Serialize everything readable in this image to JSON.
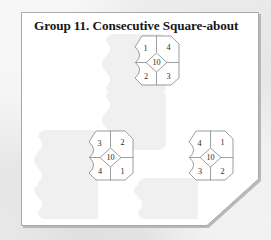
{
  "page": {
    "title": "Group 11. Consecutive Square-about",
    "background_color": "#ebeaea",
    "sheet_color": "#ffffff",
    "line_color": "#8d8d8d",
    "text_color": "#171717",
    "corner_fold": "bottom-right"
  },
  "puzzles": [
    {
      "id": "puzzle-top",
      "center": "10",
      "top_left": "1",
      "top_right": "4",
      "bottom_left": "2",
      "bottom_right": "3"
    },
    {
      "id": "puzzle-bottom-left",
      "center": "10",
      "top_left": "3",
      "top_right": "2",
      "bottom_left": "4",
      "bottom_right": "1"
    },
    {
      "id": "puzzle-bottom-right",
      "center": "10",
      "top_left": "4",
      "top_right": "1",
      "bottom_left": "3",
      "bottom_right": "2"
    }
  ]
}
